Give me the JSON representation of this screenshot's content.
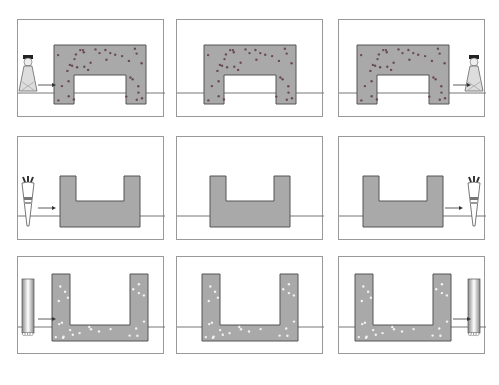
{
  "diagram": {
    "layout": {
      "rows": 3,
      "cols": 3
    },
    "colors": {
      "border": "#999999",
      "ground": "#777777",
      "block_fill": "#a9a9a9",
      "block_stroke": "#555555",
      "dot_dark": "#6b4a5a",
      "dot_light": "#f2f2f2",
      "arrow": "#333333"
    },
    "rows": [
      {
        "shape": "arch",
        "dots": "dark",
        "panels": [
          {
            "figure": "queen",
            "side": "left",
            "arrow": "right"
          },
          {
            "figure": "none"
          },
          {
            "figure": "queen",
            "side": "right",
            "arrow": "right"
          }
        ]
      },
      {
        "shape": "u-block",
        "dots": "none",
        "panels": [
          {
            "figure": "carrot",
            "side": "left",
            "arrow": "right"
          },
          {
            "figure": "none"
          },
          {
            "figure": "carrot",
            "side": "right",
            "arrow": "right"
          }
        ]
      },
      {
        "shape": "u-deep",
        "dots": "light",
        "panels": [
          {
            "figure": "column",
            "side": "left",
            "arrow": "right"
          },
          {
            "figure": "none"
          },
          {
            "figure": "column",
            "side": "right",
            "arrow": "right"
          }
        ]
      }
    ]
  }
}
